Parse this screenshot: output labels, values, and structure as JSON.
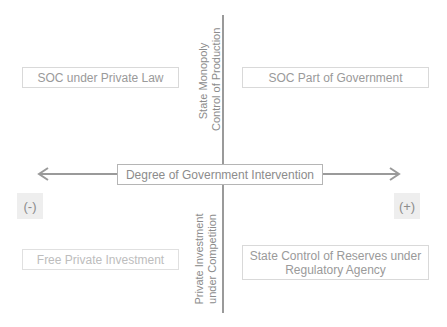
{
  "diagram": {
    "horizontal_axis_label": "Degree of Government Intervention",
    "vertical_axis_top_label": [
      "State Monopoly",
      "Control of Production"
    ],
    "vertical_axis_bottom_label": [
      "Private Investment",
      "under Competition"
    ],
    "negative_sign": "(-)",
    "positive_sign": "(+)",
    "quadrants": {
      "top_left": "SOC under Private Law",
      "top_right": "SOC Part of Government",
      "bottom_left": "Free Private Investment",
      "bottom_right_line1": "State Control of Reserves under",
      "bottom_right_line2": "Regulatory Agency"
    },
    "colors": {
      "axis": "#9a9a9a",
      "text": "#8c8c8c",
      "box_border": "#d9d9d9",
      "sign_bg": "#eeeeee"
    }
  }
}
